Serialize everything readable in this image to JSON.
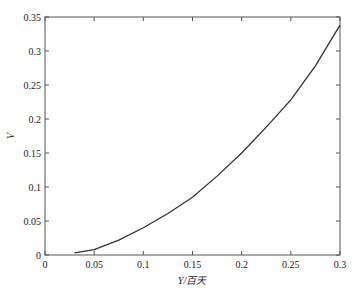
{
  "chart_data": {
    "type": "line",
    "title": "",
    "xlabel": "Y/百天",
    "ylabel": "V",
    "xlim": [
      0,
      0.3
    ],
    "ylim": [
      0,
      0.35
    ],
    "grid": false,
    "legend": null,
    "x_ticks": [
      "0",
      "0.05",
      "0.1",
      "0.15",
      "0.2",
      "0.25",
      "0.3"
    ],
    "y_ticks": [
      "0",
      "0.05",
      "0.1",
      "0.15",
      "0.2",
      "0.25",
      "0.3",
      "0.35"
    ],
    "series": [
      {
        "name": "V",
        "color": "#333333",
        "x": [
          0.03,
          0.05,
          0.075,
          0.1,
          0.125,
          0.15,
          0.175,
          0.2,
          0.225,
          0.25,
          0.275,
          0.3
        ],
        "y": [
          0.003,
          0.008,
          0.022,
          0.04,
          0.061,
          0.085,
          0.116,
          0.15,
          0.188,
          0.228,
          0.278,
          0.338
        ]
      }
    ]
  }
}
